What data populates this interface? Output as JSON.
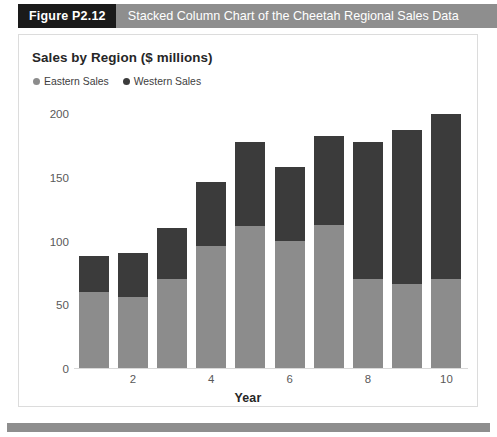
{
  "figure": {
    "number_label": "Figure P2.12",
    "caption": "Stacked Column Chart of the Cheetah Regional Sales Data"
  },
  "colors": {
    "eastern": "#8c8c8c",
    "western": "#3b3b3b",
    "caption_band": "#8e8e8e",
    "number_band": "#1a1a1a",
    "footer_band": "#8e8e8e",
    "axis_text": "#595959",
    "title_text": "#262626"
  },
  "chart_data": {
    "type": "bar",
    "subtype": "stacked-column",
    "title": "Sales by Region ($ millions)",
    "xlabel": "Year",
    "ylabel": "",
    "categories": [
      1,
      2,
      3,
      4,
      5,
      6,
      7,
      8,
      9,
      10
    ],
    "x_tick_labels": [
      "",
      "2",
      "",
      "4",
      "",
      "6",
      "",
      "8",
      "",
      "10"
    ],
    "y_tick_labels": [
      "0",
      "50",
      "100",
      "150",
      "200"
    ],
    "y_ticks": [
      0,
      50,
      100,
      150,
      200
    ],
    "ylim": [
      0,
      200
    ],
    "grid": false,
    "legend_position": "top-left",
    "series": [
      {
        "name": "Eastern Sales",
        "color": "#8c8c8c",
        "values": [
          60,
          56,
          70,
          96,
          111,
          100,
          112,
          70,
          66,
          70
        ]
      },
      {
        "name": "Western Sales",
        "color": "#3b3b3b",
        "values": [
          28,
          34,
          40,
          50,
          66,
          58,
          70,
          107,
          121,
          129
        ]
      }
    ],
    "totals": [
      88,
      90,
      110,
      146,
      177,
      158,
      182,
      177,
      187,
      199
    ]
  }
}
